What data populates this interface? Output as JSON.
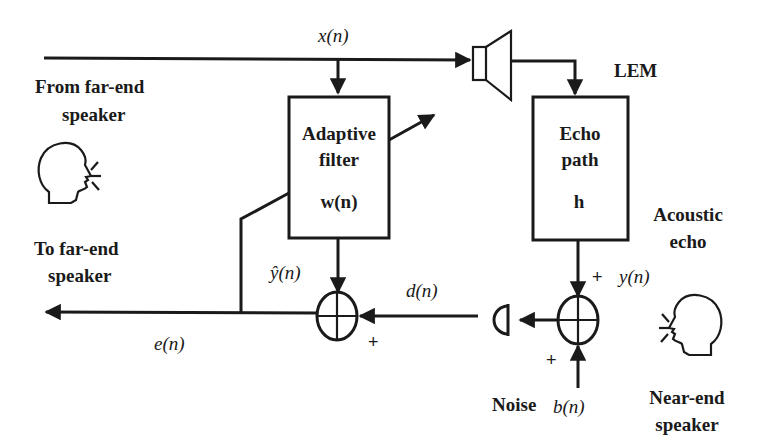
{
  "diagram": {
    "type": "block-diagram",
    "labels": {
      "from_far_end_line1": "From far-end",
      "from_far_end_line2": "speaker",
      "to_far_end_line1": "To far-end",
      "to_far_end_line2": "speaker",
      "lem": "LEM",
      "acoustic_echo_line1": "Acoustic",
      "acoustic_echo_line2": "echo",
      "near_end_line1": "Near-end",
      "near_end_line2": "speaker",
      "noise": "Noise"
    },
    "blocks": {
      "adaptive_filter": {
        "line1": "Adaptive",
        "line2": "filter",
        "param": "w(n)"
      },
      "echo_path": {
        "line1": "Echo",
        "line2": "path",
        "param": "h"
      }
    },
    "signals": {
      "x": "x(n)",
      "y_hat": "ŷ(n)",
      "d": "d(n)",
      "e": "e(n)",
      "y": "y(n)",
      "b": "b(n)"
    },
    "signs": {
      "left_sum_right_input": "+",
      "right_sum_top_input": "+",
      "right_sum_bottom_input": "+"
    },
    "icons": [
      "far-end-speaker-head-icon",
      "loudspeaker-icon",
      "microphone-icon",
      "near-end-speaker-head-icon",
      "summing-junction-icon"
    ],
    "colors": {
      "ink": "#1a1a1a",
      "background": "#ffffff"
    }
  }
}
